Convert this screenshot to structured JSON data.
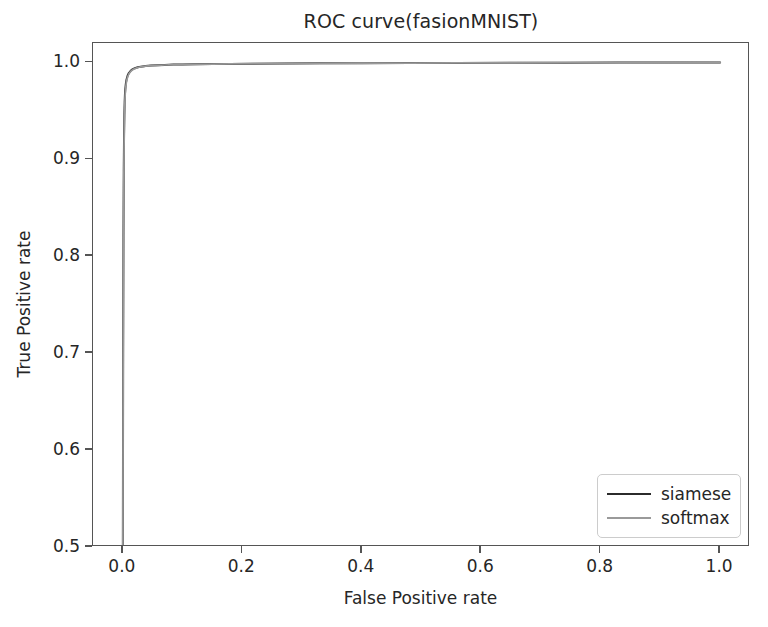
{
  "chart_data": {
    "type": "line",
    "title": "ROC curve(fasionMNIST)",
    "xlabel": "False Positive rate",
    "ylabel": "True Positive rate",
    "xlim": [
      -0.05,
      1.05
    ],
    "ylim": [
      0.5,
      1.02
    ],
    "xticks": [
      "0.0",
      "0.2",
      "0.4",
      "0.6",
      "0.8",
      "1.0"
    ],
    "xtick_values": [
      0.0,
      0.2,
      0.4,
      0.6,
      0.8,
      1.0
    ],
    "yticks": [
      "0.5",
      "0.6",
      "0.7",
      "0.8",
      "0.9",
      "1.0"
    ],
    "ytick_values": [
      0.5,
      0.6,
      0.7,
      0.8,
      0.9,
      1.0
    ],
    "grid": false,
    "legend_position": "lower right",
    "series": [
      {
        "name": "siamese",
        "color": "#2b2b2b",
        "x": [
          0.0,
          0.0005,
          0.001,
          0.0015,
          0.002,
          0.0025,
          0.003,
          0.0035,
          0.004,
          0.005,
          0.006,
          0.008,
          0.01,
          0.013,
          0.016,
          0.02,
          0.025,
          0.03,
          0.038,
          0.047,
          0.058,
          0.07,
          0.085,
          0.1,
          0.12,
          0.15,
          0.18,
          0.22,
          0.27,
          0.33,
          0.4,
          0.48,
          0.56,
          0.65,
          0.74,
          0.83,
          0.92,
          1.0
        ],
        "y": [
          0.5,
          0.7,
          0.82,
          0.888,
          0.925,
          0.946,
          0.959,
          0.967,
          0.972,
          0.978,
          0.982,
          0.9865,
          0.989,
          0.9913,
          0.9928,
          0.994,
          0.995,
          0.9956,
          0.9962,
          0.9967,
          0.9971,
          0.9974,
          0.9977,
          0.99785,
          0.998,
          0.99825,
          0.99845,
          0.99865,
          0.99885,
          0.99905,
          0.9992,
          0.99935,
          0.99948,
          0.9996,
          0.9997,
          0.9998,
          0.9999,
          1.0
        ]
      },
      {
        "name": "softmax",
        "color": "#9a9a9a",
        "x": [
          0.0,
          0.0005,
          0.001,
          0.0015,
          0.002,
          0.0025,
          0.003,
          0.0035,
          0.004,
          0.005,
          0.006,
          0.008,
          0.01,
          0.013,
          0.016,
          0.02,
          0.025,
          0.03,
          0.038,
          0.047,
          0.058,
          0.07,
          0.085,
          0.1,
          0.12,
          0.15,
          0.18,
          0.22,
          0.27,
          0.33,
          0.4,
          0.48,
          0.56,
          0.65,
          0.74,
          0.83,
          0.92,
          1.0
        ],
        "y": [
          0.5,
          0.68,
          0.8,
          0.872,
          0.913,
          0.937,
          0.952,
          0.961,
          0.968,
          0.975,
          0.98,
          0.9852,
          0.988,
          0.9906,
          0.9922,
          0.9936,
          0.9947,
          0.9954,
          0.9961,
          0.9966,
          0.997,
          0.9973,
          0.9976,
          0.9978,
          0.998,
          0.9982,
          0.9984,
          0.99862,
          0.99882,
          0.99902,
          0.99918,
          0.99933,
          0.99946,
          0.99959,
          0.99969,
          0.99979,
          0.99989,
          1.0
        ]
      }
    ],
    "legend": [
      {
        "label": "siamese",
        "color": "#2b2b2b"
      },
      {
        "label": "softmax",
        "color": "#9a9a9a"
      }
    ]
  }
}
